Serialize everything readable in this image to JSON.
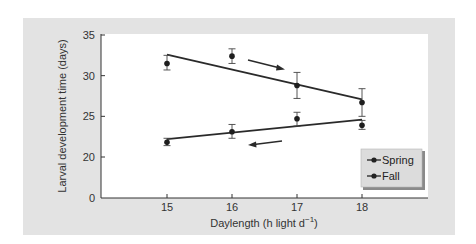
{
  "chart_data": {
    "type": "line",
    "title": "",
    "xlabel": "Daylength (h light d",
    "xlabel_superscript": "−1",
    "xlabel_suffix": ")",
    "ylabel": "Larval development time (days)",
    "x": [
      15,
      16,
      17,
      18
    ],
    "x_ticks": [
      "15",
      "16",
      "17",
      "18"
    ],
    "y_ticks": [
      "0",
      "20",
      "25",
      "30",
      "35"
    ],
    "y_axis_break": "0 then jump to 20",
    "ylim": [
      0,
      35
    ],
    "grid": false,
    "legend_position": "lower right",
    "series": [
      {
        "name": "Spring",
        "marker": "filled circle",
        "values": [
          31.5,
          32.4,
          28.8,
          26.7
        ],
        "error_low": [
          30.7,
          31.5,
          27.2,
          25.0
        ],
        "error_high": [
          32.5,
          33.3,
          30.4,
          28.4
        ],
        "fit_line": {
          "x_start": 15,
          "y_start": 32.6,
          "x_end": 18,
          "y_end": 27.1
        },
        "direction_arrow": "right (increasing daylength)"
      },
      {
        "name": "Fall",
        "marker": "filled circle",
        "values": [
          21.8,
          23.1,
          24.7,
          23.9
        ],
        "error_low": [
          21.4,
          22.3,
          23.8,
          23.4
        ],
        "error_high": [
          22.3,
          24.0,
          25.5,
          24.5
        ],
        "fit_line": {
          "x_start": 15,
          "y_start": 22.2,
          "x_end": 18,
          "y_end": 24.6
        },
        "direction_arrow": "left (decreasing daylength)"
      }
    ]
  },
  "legend": {
    "items": [
      {
        "label": "Spring"
      },
      {
        "label": "Fall"
      }
    ]
  },
  "colors": {
    "panel_bg": "#e3e3e3",
    "plot_bg": "#ffffff",
    "line": "#2a2a2a",
    "legend_bg": "#dcdcdc",
    "legend_shadow": "#8a8a8a"
  }
}
